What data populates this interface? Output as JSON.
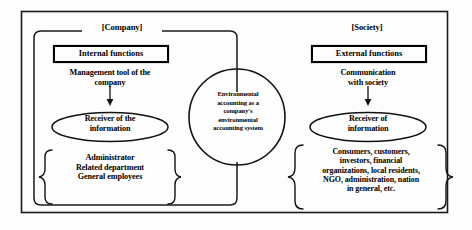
{
  "diagram": {
    "title": "Environmental accounting as a company's environmental accounting system",
    "regions": {
      "company": {
        "label": "[Company]",
        "heading": "Internal functions",
        "caption": "Management tool of the\ncompany",
        "receiver": "Receiver of the\ninformation",
        "stakeholders": "Administrator\nRelated department\nGeneral employees"
      },
      "society": {
        "label": "[Society]",
        "heading": "External functions",
        "caption": "Communication\nwith society",
        "receiver": "Receiver of\ninformation",
        "stakeholders": "Consumers, customers,\ninvestors, financial\norganizations, local residents,\nNGO, administration, nation\nin general, etc."
      }
    },
    "center": {
      "text": "Environmental\naccounting as a\ncompany's\nenvironmental\naccounting system"
    },
    "colors": {
      "stroke": "#1a1a1a",
      "background": "#fdfdfd",
      "text": "#000000"
    }
  }
}
